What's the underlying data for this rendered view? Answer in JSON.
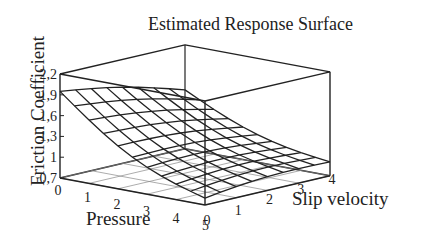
{
  "chart_data": {
    "type": "surface3d",
    "title": "Estimated Response Surface",
    "xlabel": "Pressure",
    "ylabel": "Slip velocity",
    "zlabel": "Friction Coefficient",
    "x_ticks": [
      "0",
      "1",
      "2",
      "3",
      "4",
      "5"
    ],
    "y_ticks": [
      "0",
      "1",
      "2",
      "3",
      "4"
    ],
    "z_ticks": [
      "0,7",
      "1",
      "1,3",
      "1,6",
      "1,9",
      "2,2"
    ],
    "xlim": [
      0,
      5
    ],
    "ylim": [
      0,
      4
    ],
    "zlim": [
      0.7,
      2.2
    ],
    "grid_x": [
      0,
      0.5,
      1,
      1.5,
      2,
      2.5,
      3,
      3.5,
      4,
      4.5,
      5
    ],
    "grid_y": [
      0,
      0.5,
      1,
      1.5,
      2,
      2.5,
      3,
      3.5,
      4
    ],
    "surface_corners": {
      "pressure0_slip0": 1.95,
      "pressure5_slip0": 0.8,
      "pressure0_slip4": 1.55,
      "pressure5_slip4": 0.9
    },
    "floor_projection": true,
    "box": true
  }
}
